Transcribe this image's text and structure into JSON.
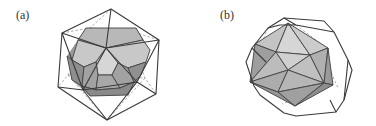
{
  "figure": {
    "panels": [
      {
        "label": "(a)",
        "description": "Dodecahedron (shaded) inscribed in a wireframe icosahedron",
        "inner_solid": "dodecahedron",
        "outer_solid": "icosahedron"
      },
      {
        "label": "(b)",
        "description": "Icosahedron (shaded) inscribed in a wireframe dodecahedron",
        "inner_solid": "icosahedron",
        "outer_solid": "dodecahedron"
      }
    ],
    "colors": {
      "inner_fill_dark": "#9a9a9a",
      "inner_fill_mid": "#b4b4b4",
      "inner_fill_light": "#d2d2d2",
      "wire": "#3a3a3a",
      "hidden_wire": "#777777"
    }
  }
}
